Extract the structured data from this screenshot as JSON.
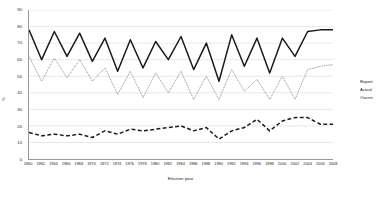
{
  "chart_data": {
    "type": "line",
    "title": "",
    "xlabel": "Election year",
    "ylabel": "%",
    "ylim": [
      0,
      90
    ],
    "ytick_step": 10,
    "grid": true,
    "legend_position": "right",
    "yticks": [
      "90",
      "80",
      "70",
      "60",
      "50",
      "40",
      "30",
      "20",
      "10",
      "0"
    ],
    "categories": [
      "1960",
      "1962",
      "1964",
      "1966",
      "1968",
      "1970",
      "1972",
      "1974",
      "1976",
      "1978",
      "1980",
      "1982",
      "1984",
      "1986",
      "1988",
      "1990",
      "1992",
      "1994",
      "1996",
      "1998",
      "2000",
      "2002",
      "2004",
      "2006",
      "2008"
    ],
    "x_tick_labels": [
      "1960",
      "1962",
      "1964",
      "1966",
      "1968",
      "1970",
      "1972",
      "1974",
      "1976",
      "1978",
      "1980",
      "1982",
      "1984",
      "1986",
      "1988",
      "1990",
      "1992",
      "1994",
      "1996",
      "1998",
      "2000",
      "2002",
      "2004",
      "2006",
      "2008"
    ],
    "series": [
      {
        "name": "Reported",
        "style": "solid",
        "color": "#1a1a1a",
        "values": [
          78,
          60,
          77,
          62,
          76,
          59,
          73,
          53,
          72,
          55,
          71,
          60,
          74,
          54,
          70,
          47,
          75,
          56,
          73,
          52,
          73,
          62,
          77,
          78,
          78
        ]
      },
      {
        "name": "Actual",
        "style": "dotted",
        "color": "#7a7a7a",
        "values": [
          62,
          47,
          61,
          49,
          60,
          47,
          55,
          39,
          53,
          37,
          52,
          40,
          53,
          36,
          50,
          36,
          54,
          41,
          48,
          36,
          50,
          36,
          54,
          56,
          57
        ]
      },
      {
        "name": "Overreport",
        "style": "dashed",
        "color": "#1a1a1a",
        "values": [
          16,
          14,
          15,
          14,
          15,
          13,
          17,
          15,
          18,
          17,
          18,
          19,
          20,
          17,
          19,
          12,
          17,
          19,
          24,
          17,
          23,
          25,
          25,
          21,
          21
        ]
      }
    ]
  },
  "legend": {
    "items": [
      {
        "label": "Report",
        "style": "solid"
      },
      {
        "label": "Actual",
        "style": "dotted"
      },
      {
        "label": "Overre",
        "style": "dashed"
      }
    ]
  }
}
